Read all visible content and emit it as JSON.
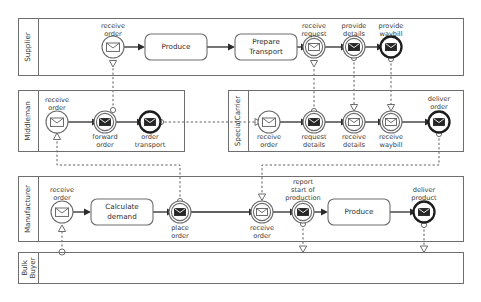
{
  "diagram": {
    "type": "bpmn-collaboration",
    "pools": [
      {
        "id": "supplier",
        "label": "Supplier",
        "black_box": false,
        "x": 18,
        "y": 18,
        "w": 446,
        "h": 58,
        "header_w": 20
      },
      {
        "id": "middleman",
        "label": "Middleman",
        "black_box": false,
        "x": 18,
        "y": 90,
        "w": 167,
        "h": 62,
        "header_w": 20
      },
      {
        "id": "specialcarrier",
        "label": "SpecialCarrier",
        "black_box": false,
        "x": 228,
        "y": 90,
        "w": 236,
        "h": 62,
        "header_w": 20
      },
      {
        "id": "manufacturer",
        "label": "Manufacturer",
        "black_box": false,
        "x": 18,
        "y": 176,
        "w": 446,
        "h": 66,
        "header_w": 20
      },
      {
        "id": "bulkbuyer",
        "label": "Bulk\nBuyer",
        "label_line1": "Bulk",
        "label_line2": "Buyer",
        "black_box": true,
        "x": 18,
        "y": 252,
        "w": 446,
        "h": 32,
        "header_w": 20
      }
    ],
    "tasks": [
      {
        "id": "produce-supplier",
        "pool": "supplier",
        "label": "Produce",
        "cx": 176,
        "cy": 47,
        "w": 62,
        "h": 26
      },
      {
        "id": "prepare-transport",
        "pool": "supplier",
        "label_line1": "Prepare",
        "label_line2": "Transport",
        "cx": 266,
        "cy": 47,
        "w": 62,
        "h": 26
      },
      {
        "id": "calculate-demand",
        "pool": "manufacturer",
        "label_line1": "Calculate",
        "label_line2": "demand",
        "cx": 122,
        "cy": 212,
        "w": 62,
        "h": 26
      },
      {
        "id": "produce-manufacturer",
        "pool": "manufacturer",
        "label": "Produce",
        "cx": 359,
        "cy": 212,
        "w": 62,
        "h": 26
      }
    ],
    "events": [
      {
        "id": "supplier-receive-order",
        "pool": "supplier",
        "label_line1": "receive",
        "label_line2": "order",
        "label_pos": "above",
        "cx": 113,
        "cy": 47,
        "kind": "start-message",
        "marker": "envelope-open"
      },
      {
        "id": "supplier-receive-request",
        "pool": "supplier",
        "label_line1": "receive",
        "label_line2": "request",
        "label_pos": "above",
        "cx": 314,
        "cy": 47,
        "kind": "intermediate-catch-message",
        "marker": "envelope-open"
      },
      {
        "id": "supplier-provide-details",
        "pool": "supplier",
        "label_line1": "provide",
        "label_line2": "details",
        "label_pos": "above",
        "cx": 354,
        "cy": 47,
        "kind": "intermediate-throw-message",
        "marker": "envelope-filled"
      },
      {
        "id": "supplier-provide-waybill",
        "pool": "supplier",
        "label_line1": "provide",
        "label_line2": "waybill",
        "label_pos": "above",
        "cx": 391,
        "cy": 47,
        "kind": "end-message",
        "marker": "envelope-filled"
      },
      {
        "id": "middleman-receive-order",
        "pool": "middleman",
        "label_line1": "receive",
        "label_line2": "order",
        "label_pos": "above",
        "cx": 57,
        "cy": 122,
        "kind": "start-message",
        "marker": "envelope-open"
      },
      {
        "id": "middleman-forward-order",
        "pool": "middleman",
        "label_line1": "forward",
        "label_line2": "order",
        "label_pos": "below",
        "cx": 105,
        "cy": 122,
        "kind": "intermediate-throw-message",
        "marker": "envelope-filled"
      },
      {
        "id": "middleman-order-transport",
        "pool": "middleman",
        "label_line1": "order",
        "label_line2": "transport",
        "label_pos": "below",
        "cx": 150,
        "cy": 122,
        "kind": "end-message",
        "marker": "envelope-filled"
      },
      {
        "id": "carrier-receive-order",
        "pool": "specialcarrier",
        "label_line1": "receive",
        "label_line2": "order",
        "label_pos": "below",
        "cx": 269,
        "cy": 122,
        "kind": "start-message",
        "marker": "envelope-open"
      },
      {
        "id": "carrier-request-details",
        "pool": "specialcarrier",
        "label_line1": "request",
        "label_line2": "details",
        "label_pos": "below",
        "cx": 314,
        "cy": 122,
        "kind": "intermediate-throw-message",
        "marker": "envelope-filled"
      },
      {
        "id": "carrier-receive-details",
        "pool": "specialcarrier",
        "label_line1": "receive",
        "label_line2": "details",
        "label_pos": "below",
        "cx": 354,
        "cy": 122,
        "kind": "intermediate-catch-message",
        "marker": "envelope-open"
      },
      {
        "id": "carrier-receive-waybill",
        "pool": "specialcarrier",
        "label_line1": "receive",
        "label_line2": "waybill",
        "label_pos": "below",
        "cx": 391,
        "cy": 122,
        "kind": "intermediate-catch-message",
        "marker": "envelope-open"
      },
      {
        "id": "carrier-deliver-order",
        "pool": "specialcarrier",
        "label_line1": "deliver",
        "label_line2": "order",
        "label_pos": "above",
        "cx": 439,
        "cy": 122,
        "kind": "end-message",
        "marker": "envelope-filled"
      },
      {
        "id": "manufacturer-receive-order",
        "pool": "manufacturer",
        "label_line1": "receive",
        "label_line2": "order",
        "label_pos": "above",
        "cx": 62,
        "cy": 212,
        "kind": "start-message",
        "marker": "envelope-open"
      },
      {
        "id": "manufacturer-place-order",
        "pool": "manufacturer",
        "label_line1": "place",
        "label_line2": "order",
        "label_pos": "below",
        "cx": 180,
        "cy": 212,
        "kind": "intermediate-throw-message",
        "marker": "envelope-filled"
      },
      {
        "id": "manufacturer-receive-order-2",
        "pool": "manufacturer",
        "label_line1": "receive",
        "label_line2": "order",
        "label_pos": "below",
        "cx": 262,
        "cy": 212,
        "kind": "intermediate-catch-message",
        "marker": "envelope-open"
      },
      {
        "id": "manufacturer-report-start-production",
        "pool": "manufacturer",
        "label_line1": "report",
        "label_line2": "start of",
        "label_line3": "production",
        "label_pos": "above",
        "cx": 303,
        "cy": 212,
        "kind": "intermediate-throw-message",
        "marker": "envelope-filled"
      },
      {
        "id": "manufacturer-deliver-product",
        "pool": "manufacturer",
        "label_line1": "deliver",
        "label_line2": "product",
        "label_pos": "above",
        "cx": 424,
        "cy": 212,
        "kind": "end-message",
        "marker": "envelope-filled"
      }
    ],
    "sequence_flows": [
      {
        "from": "supplier-receive-order",
        "to": "produce-supplier"
      },
      {
        "from": "produce-supplier",
        "to": "prepare-transport"
      },
      {
        "from": "prepare-transport",
        "to": "supplier-receive-request"
      },
      {
        "from": "supplier-receive-request",
        "to": "supplier-provide-details"
      },
      {
        "from": "supplier-provide-details",
        "to": "supplier-provide-waybill"
      },
      {
        "from": "middleman-receive-order",
        "to": "middleman-forward-order"
      },
      {
        "from": "middleman-forward-order",
        "to": "middleman-order-transport"
      },
      {
        "from": "carrier-receive-order",
        "to": "carrier-request-details"
      },
      {
        "from": "carrier-request-details",
        "to": "carrier-receive-details"
      },
      {
        "from": "carrier-receive-details",
        "to": "carrier-receive-waybill"
      },
      {
        "from": "carrier-receive-waybill",
        "to": "carrier-deliver-order"
      },
      {
        "from": "manufacturer-receive-order",
        "to": "calculate-demand"
      },
      {
        "from": "calculate-demand",
        "to": "manufacturer-place-order"
      },
      {
        "from": "manufacturer-place-order",
        "to": "manufacturer-receive-order-2"
      },
      {
        "from": "manufacturer-receive-order-2",
        "to": "manufacturer-report-start-production"
      },
      {
        "from": "manufacturer-report-start-production",
        "to": "produce-manufacturer"
      },
      {
        "from": "produce-manufacturer",
        "to": "manufacturer-deliver-product"
      }
    ],
    "message_flows": [
      {
        "from": "middleman-forward-order",
        "to": "supplier-receive-order"
      },
      {
        "from": "middleman-order-transport",
        "to": "carrier-receive-order"
      },
      {
        "from": "carrier-request-details",
        "to": "supplier-receive-request"
      },
      {
        "from": "supplier-provide-details",
        "to": "carrier-receive-details"
      },
      {
        "from": "supplier-provide-waybill",
        "to": "carrier-receive-waybill"
      },
      {
        "from": "manufacturer-place-order",
        "to": "middleman-receive-order"
      },
      {
        "from": "carrier-deliver-order",
        "to": "manufacturer-receive-order-2"
      },
      {
        "from": "manufacturer-report-start-production",
        "to": "bulkbuyer"
      },
      {
        "from": "manufacturer-deliver-product",
        "to": "bulkbuyer"
      },
      {
        "from": "bulkbuyer",
        "to": "manufacturer-receive-order"
      }
    ]
  }
}
